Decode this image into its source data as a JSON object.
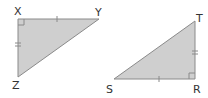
{
  "colors": {
    "fill": "#cfcfcf",
    "stroke": "#8a8a8a",
    "text": "#333333",
    "background": "#ffffff"
  },
  "triangles": [
    {
      "name": "XYZ",
      "vertices": [
        {
          "label": "X",
          "x": 18,
          "y": 19,
          "right_angle": true
        },
        {
          "label": "Y",
          "x": 99,
          "y": 19,
          "right_angle": false
        },
        {
          "label": "Z",
          "x": 18,
          "y": 77,
          "right_angle": false
        }
      ],
      "ticks": [
        {
          "side": "XY",
          "count": 1
        },
        {
          "side": "XZ",
          "count": 2
        }
      ]
    },
    {
      "name": "TSR",
      "vertices": [
        {
          "label": "T",
          "x": 195,
          "y": 21,
          "right_angle": false
        },
        {
          "label": "S",
          "x": 114,
          "y": 79,
          "right_angle": false
        },
        {
          "label": "R",
          "x": 195,
          "y": 79,
          "right_angle": true
        }
      ],
      "ticks": [
        {
          "side": "SR",
          "count": 1
        },
        {
          "side": "TR",
          "count": 2
        }
      ]
    }
  ]
}
